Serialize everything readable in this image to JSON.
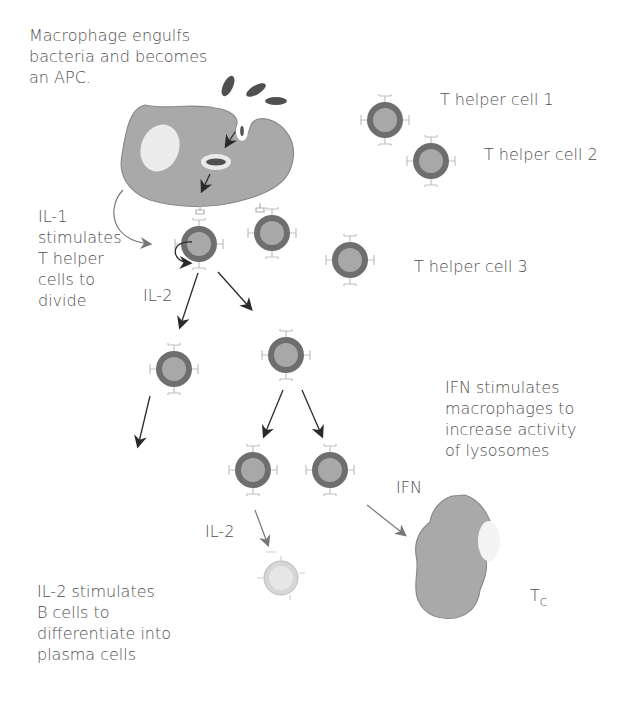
{
  "diagram": {
    "labels": {
      "macrophage_apc": [
        "Macrophage engulfs",
        "bacteria and becomes",
        "an APC."
      ],
      "th1": "T helper cell 1",
      "th2": "T helper cell 2",
      "th3": "T helper cell 3",
      "il1": [
        "IL-1",
        "stimulates",
        "T helper",
        "cells to",
        "divide"
      ],
      "il2_top": "IL-2",
      "il2_bottom": "IL-2",
      "ifn_desc": [
        "IFN stimulates",
        "macrophages to",
        "increase activity",
        "of lysosomes"
      ],
      "ifn": "IFN",
      "tc_main": "T",
      "tc_sub": "C",
      "il2_desc": [
        "IL-2 stimulates",
        "B cells to",
        "differentiate into",
        "plasma cells"
      ]
    },
    "colors": {
      "macrophage": "#a9a9a9",
      "cell_outer": "#6e6e6e",
      "cell_inner": "#a8a8a8",
      "bacteria": "#505050",
      "b_cell": "#d6d6d6",
      "arrow": "#2a2a2a",
      "text": "#505050"
    }
  }
}
